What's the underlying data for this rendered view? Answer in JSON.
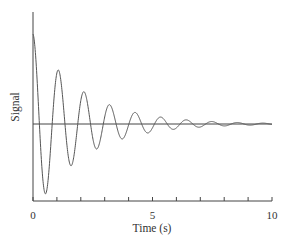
{
  "chart_data": {
    "type": "line",
    "title": "",
    "xlabel": "Time (s)",
    "ylabel": "Signal",
    "xlim": [
      0,
      10
    ],
    "ylim": [
      -1.0,
      1.1
    ],
    "x_ticks": [
      0,
      1,
      2,
      3,
      4,
      5,
      6,
      7,
      8,
      9,
      10
    ],
    "x_tick_labels": [
      {
        "value": 0,
        "label": "0"
      },
      {
        "value": 5,
        "label": "5"
      },
      {
        "value": 10,
        "label": "10"
      }
    ],
    "y_ticks": [],
    "grid": false,
    "legend": null,
    "baseline": {
      "y": 0,
      "from": 0,
      "to": 10
    },
    "series": [
      {
        "name": "Signal",
        "model": "damped cosine: A*exp(-gamma*t)*cos(omega*t)",
        "amplitude": 1.0,
        "gamma": 0.48,
        "period": 1.07,
        "color": "#555555",
        "sample_points": [
          {
            "t": 0.0,
            "y": 1.0
          },
          {
            "t": 0.535,
            "y": -0.74
          },
          {
            "t": 1.07,
            "y": 0.6
          },
          {
            "t": 1.605,
            "y": -0.44
          },
          {
            "t": 2.14,
            "y": 0.36
          },
          {
            "t": 2.675,
            "y": -0.26
          },
          {
            "t": 3.21,
            "y": 0.22
          },
          {
            "t": 3.745,
            "y": -0.15
          },
          {
            "t": 4.28,
            "y": 0.13
          },
          {
            "t": 5.35,
            "y": 0.08
          },
          {
            "t": 6.42,
            "y": 0.05
          },
          {
            "t": 7.49,
            "y": 0.03
          },
          {
            "t": 8.56,
            "y": 0.02
          },
          {
            "t": 9.63,
            "y": 0.01
          }
        ]
      }
    ]
  },
  "colors": {
    "axis": "#444444",
    "curve": "#555555",
    "baseline": "#444444",
    "text": "#333333"
  }
}
